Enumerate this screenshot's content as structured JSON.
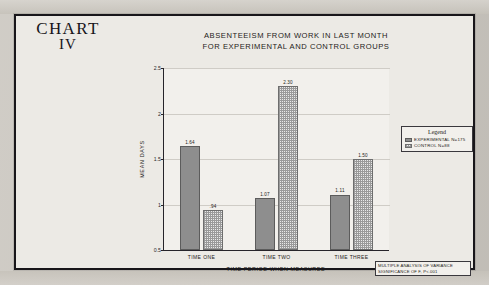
{
  "chart_label": {
    "line1": "CHART",
    "line2": "IV"
  },
  "title": {
    "line1": "ABSENTEEISM FROM WORK IN LAST MONTH",
    "line2": "FOR EXPERIMENTAL AND CONTROL GROUPS"
  },
  "legend": {
    "heading": "Legend",
    "entries": [
      {
        "label": "EXPERIMENTAL N=175",
        "pattern": "solid-gray",
        "color": "#8e8e8e"
      },
      {
        "label": "CONTROL N=88",
        "pattern": "dotted-gray",
        "color": "#e9e9e9"
      }
    ]
  },
  "footnote": {
    "line1": "MULTIPLE ANALYSIS OF VARIANCE",
    "line2": "SIGNIFICANCE OF F, P<.001"
  },
  "chart_data": {
    "type": "bar",
    "title": "ABSENTEEISM FROM WORK IN LAST MONTH FOR EXPERIMENTAL AND CONTROL GROUPS",
    "xlabel": "TIME PERIOD WHEN MEASURED",
    "ylabel": "MEAN DAYS",
    "categories": [
      "TIME ONE",
      "TIME TWO",
      "TIME THREE"
    ],
    "series": [
      {
        "name": "EXPERIMENTAL N=175",
        "values": [
          1.64,
          1.07,
          1.11
        ],
        "labels": [
          "1.64",
          "1.07",
          "1.11"
        ]
      },
      {
        "name": "CONTROL N=88",
        "values": [
          0.94,
          2.3,
          1.5
        ],
        "labels": [
          ".94",
          "2.30",
          "1.50"
        ]
      }
    ],
    "ylim": [
      0.5,
      2.5
    ],
    "yticks": [
      0.5,
      1,
      1.5,
      2,
      2.5
    ],
    "ytick_labels": [
      "0.5",
      "1",
      "1.5",
      "2",
      "2.5"
    ],
    "grid": true,
    "legend_position": "right"
  }
}
